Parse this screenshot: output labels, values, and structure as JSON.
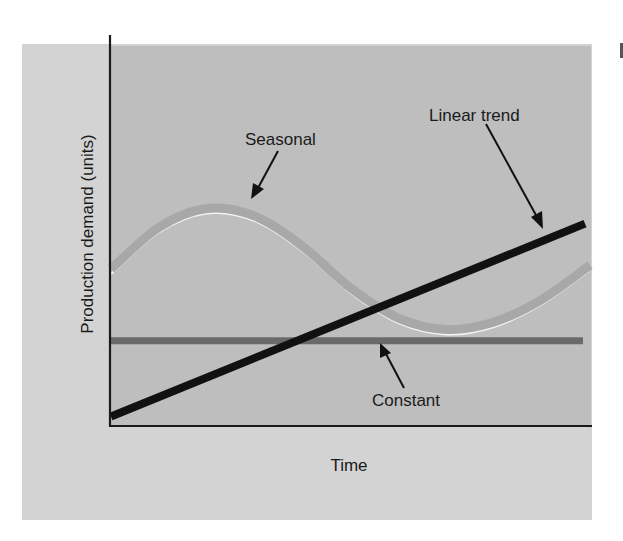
{
  "chart_data": {
    "type": "line",
    "title": "",
    "xlabel": "Time",
    "ylabel": "Production demand (units)",
    "grid": false,
    "legend": "none (inline annotations with arrows)",
    "x_range": [
      0,
      10
    ],
    "y_range": [
      0,
      10
    ],
    "x_ticks": [],
    "y_ticks": [],
    "series": [
      {
        "name": "Seasonal",
        "style": "thick grey band with white highlight",
        "color": "#a8a8a8",
        "x": [
          0,
          1,
          2,
          3,
          4,
          5,
          6,
          7,
          8,
          9,
          10
        ],
        "values": [
          4.1,
          5.2,
          5.7,
          5.5,
          4.7,
          3.6,
          2.8,
          2.5,
          2.7,
          3.3,
          4.2
        ]
      },
      {
        "name": "Linear trend",
        "style": "thick black line",
        "color": "#111111",
        "x": [
          0,
          10
        ],
        "values": [
          0.2,
          5.3
        ]
      },
      {
        "name": "Constant",
        "style": "thick dark grey line",
        "color": "#6a6a6a",
        "x": [
          0,
          10
        ],
        "values": [
          2.2,
          2.2
        ]
      }
    ],
    "annotations": [
      {
        "text": "Seasonal",
        "points_to": "Seasonal peak"
      },
      {
        "text": "Linear trend",
        "points_to": "Linear trend near right end"
      },
      {
        "text": "Constant",
        "points_to": "Constant line"
      }
    ]
  },
  "labels": {
    "seasonal": "Seasonal",
    "linear_trend": "Linear trend",
    "constant": "Constant",
    "x_axis": "Time",
    "y_axis": "Production demand (units)"
  },
  "colors": {
    "page_bg": "#ffffff",
    "panel_bg": "#d3d3d3",
    "plot_bg": "#bebebe",
    "axis": "#1a1a1a",
    "seasonal": "#a8a8a8",
    "seasonal_highlight": "#f4f4f4",
    "linear_trend": "#111111",
    "constant": "#6a6a6a"
  }
}
